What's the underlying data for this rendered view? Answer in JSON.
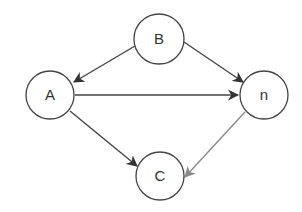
{
  "diagram": {
    "type": "directed-graph",
    "background": "#ffffff",
    "stroke_color": "#444444",
    "light_stroke_color": "#8a8a8a",
    "nodes": [
      {
        "id": "B",
        "label": "B",
        "cx": 159,
        "cy": 39,
        "r": 25
      },
      {
        "id": "A",
        "label": "A",
        "cx": 50,
        "cy": 95,
        "r": 24
      },
      {
        "id": "n",
        "label": "n",
        "cx": 264,
        "cy": 95,
        "r": 24
      },
      {
        "id": "C",
        "label": "C",
        "cx": 160,
        "cy": 176,
        "r": 24
      }
    ],
    "edges": [
      {
        "from": "B",
        "to": "A",
        "x1": 135,
        "y1": 46,
        "x2": 74,
        "y2": 82,
        "color": "#444444"
      },
      {
        "from": "B",
        "to": "n",
        "x1": 184,
        "y1": 42,
        "x2": 243,
        "y2": 82,
        "color": "#444444"
      },
      {
        "from": "A",
        "to": "n",
        "x1": 75,
        "y1": 95,
        "x2": 238,
        "y2": 95,
        "color": "#444444"
      },
      {
        "from": "A",
        "to": "C",
        "x1": 70,
        "y1": 111,
        "x2": 137,
        "y2": 166,
        "color": "#444444"
      },
      {
        "from": "n",
        "to": "C",
        "x1": 245,
        "y1": 112,
        "x2": 185,
        "y2": 177,
        "color": "#8a8a8a"
      }
    ]
  }
}
